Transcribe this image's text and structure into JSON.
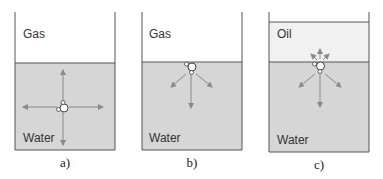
{
  "figure": {
    "panels": [
      {
        "id": "a",
        "caption": "a)",
        "upper_phase": "Gas",
        "lower_phase": "Water",
        "molecule_position": "bulk",
        "arrows": "up, down, left, right (balanced)"
      },
      {
        "id": "b",
        "caption": "b)",
        "upper_phase": "Gas",
        "lower_phase": "Water",
        "molecule_position": "surface",
        "arrows": "down, down-left, down-right"
      },
      {
        "id": "c",
        "caption": "c)",
        "upper_phase": "Oil",
        "lower_phase": "Water",
        "molecule_position": "interface",
        "arrows": "small up arrows into oil, larger down arrows into water"
      }
    ]
  },
  "colors": {
    "water": "#d6d6d6",
    "oil": "#f1f1f1",
    "gas": "#ffffff",
    "line": "#555555",
    "arrow": "#8a8a8a"
  }
}
